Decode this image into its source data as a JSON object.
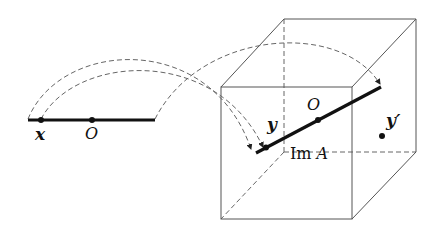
{
  "diagram": {
    "type": "linear-map-illustration",
    "colors": {
      "stroke": "#111111",
      "thin": "#555555",
      "dashed": "#666666",
      "background": "#ffffff"
    },
    "domain_line": {
      "points": [
        {
          "label": "x",
          "name": "point-x"
        },
        {
          "label": "O",
          "name": "origin-domain"
        }
      ]
    },
    "cube": {
      "image_line_label": "Im A",
      "image_line_label_main": "Im ",
      "image_line_label_var": "A",
      "points": [
        {
          "label": "y",
          "name": "point-y"
        },
        {
          "label": "O",
          "name": "origin-image"
        },
        {
          "label": "y′",
          "name": "point-y-prime"
        }
      ]
    },
    "mappings": [
      {
        "from": "domain-left-end",
        "to": "image-left-end",
        "style": "dashed-arrow"
      },
      {
        "from": "point-x",
        "to": "point-y",
        "style": "dashed-arrow"
      },
      {
        "from": "domain-right-end",
        "to": "image-right-end",
        "style": "dashed-arrow"
      }
    ]
  }
}
